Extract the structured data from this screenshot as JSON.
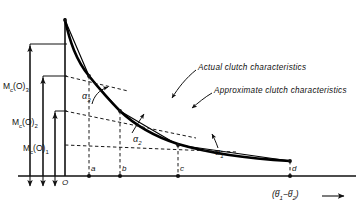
{
  "figure": {
    "axes": {
      "origin_label": "O",
      "x_axis_label_html": "(θ̇1 − θ̇2)",
      "x_axis_label_plain": "(θ·1 - θ·2)",
      "x_axis_arrow": "→",
      "x_ticks": [
        {
          "key": "a",
          "label": "a",
          "x": 89
        },
        {
          "key": "b",
          "label": "b",
          "x": 120
        },
        {
          "key": "c",
          "label": "c",
          "x": 178
        },
        {
          "key": "d",
          "label": "d",
          "x": 290
        }
      ]
    },
    "moment_labels": [
      {
        "key": "mc3",
        "text": "M",
        "sub1": "c",
        "mid": "(O)",
        "sub2": "3"
      },
      {
        "key": "mc2",
        "text": "M",
        "sub1": "c",
        "mid": "(O)",
        "sub2": "2"
      },
      {
        "key": "mc1",
        "text": "M",
        "sub1": "c",
        "mid": "(O)",
        "sub2": "1"
      }
    ],
    "angles": [
      {
        "key": "alpha3",
        "text": "α",
        "sub": "3"
      },
      {
        "key": "alpha2",
        "text": "α",
        "sub": "2"
      },
      {
        "key": "alpha1",
        "text": "α",
        "sub": "1"
      }
    ],
    "annotations": [
      {
        "key": "actual",
        "label": "Actual clutch characteristics"
      },
      {
        "key": "approximate",
        "label": "Approximate clutch characteristics"
      }
    ],
    "colors": {
      "ink": "#111111",
      "background": "#ffffff",
      "curve": "#000000",
      "dashed": "#1a1a1a"
    }
  }
}
